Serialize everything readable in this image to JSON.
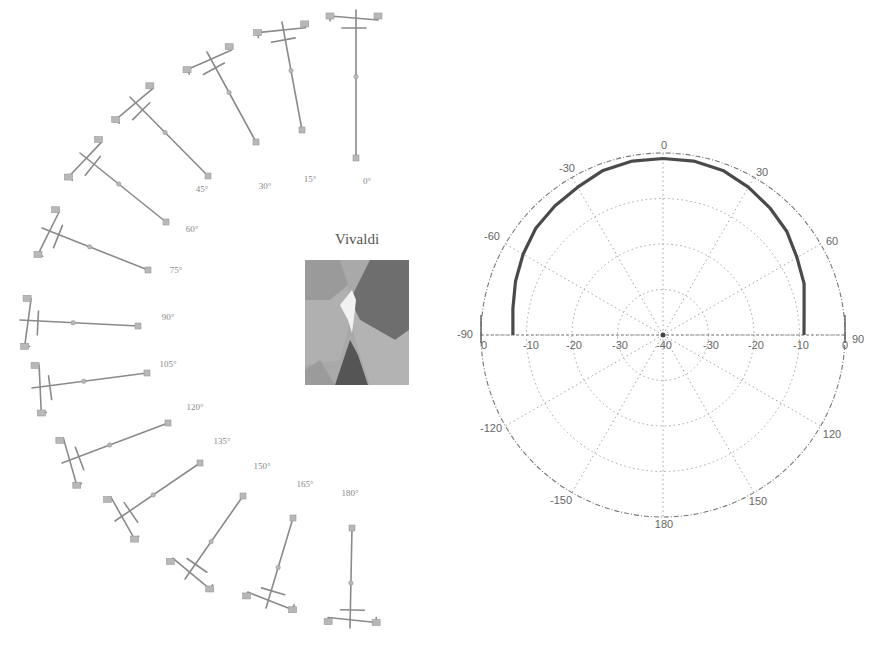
{
  "figure": {
    "central_image": {
      "title": "Vivaldi",
      "description": "grayscale rendering of a Vivaldi (tapered slot) antenna pattern"
    },
    "stick_figures": {
      "description": "series of sampled configurations arranged in a semicircular arc around the central image",
      "angles": [
        "0°",
        "15°",
        "30°",
        "45°",
        "60°",
        "75°",
        "90°",
        "105°",
        "120°",
        "135°",
        "150°",
        "165°",
        "180°"
      ]
    },
    "polar_plot": {
      "angle_labels": [
        "0",
        "30",
        "60",
        "90",
        "120",
        "150",
        "180",
        "-150",
        "-120",
        "-90",
        "-60",
        "-30"
      ],
      "radial_labels_left": [
        "0",
        "-10",
        "-20",
        "-30"
      ],
      "radial_labels_right": [
        "-30",
        "-20",
        "-10",
        "0"
      ],
      "center_label": "-40"
    }
  },
  "chart_data": {
    "type": "polar",
    "title": "",
    "angle_unit": "degrees",
    "angle_ticks": [
      0,
      30,
      60,
      90,
      120,
      150,
      180,
      -150,
      -120,
      -90,
      -60,
      -30
    ],
    "radial_ticks": [
      0,
      -10,
      -20,
      -30,
      -40
    ],
    "rlim": [
      -40,
      0
    ],
    "grid": true,
    "series": [
      {
        "name": "radiation pattern",
        "theta": [
          -90,
          -80,
          -70,
          -60,
          -50,
          -40,
          -30,
          -20,
          -10,
          0,
          10,
          20,
          30,
          40,
          50,
          60,
          70,
          80,
          90
        ],
        "r": [
          -7,
          -6.5,
          -5.5,
          -4.5,
          -3.5,
          -3,
          -2.5,
          -1.5,
          -1.2,
          -1.2,
          -1.2,
          -1.5,
          -2.5,
          -3.5,
          -4.5,
          -6,
          -7,
          -8.5,
          -9
        ]
      }
    ]
  }
}
